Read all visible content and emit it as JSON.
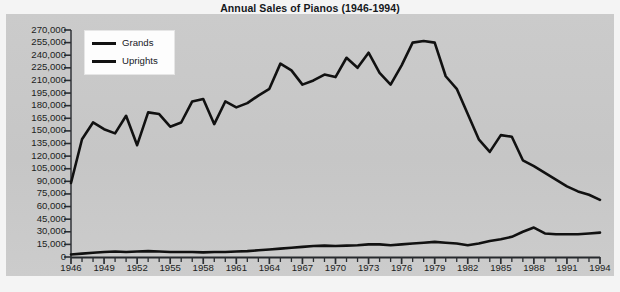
{
  "chart_data": {
    "type": "line",
    "title": "Annual Sales of Pianos (1946-1994)",
    "xlabel": "",
    "ylabel": "",
    "xlim": [
      1946,
      1994
    ],
    "ylim": [
      0,
      270000
    ],
    "ytick_step": 15000,
    "xtick_step": 3,
    "grid": false,
    "legend_position": "top-left",
    "yticks": [
      "270,000",
      "255,000",
      "240,000",
      "225,000",
      "210,000",
      "195,000",
      "180,000",
      "165,000",
      "150,000",
      "135,000",
      "120,000",
      "105,000",
      "90,000",
      "75,000",
      "60,000",
      "45,000",
      "30,000",
      "15,000",
      "0"
    ],
    "ytick_values": [
      270000,
      255000,
      240000,
      225000,
      210000,
      195000,
      180000,
      165000,
      150000,
      135000,
      120000,
      105000,
      90000,
      75000,
      60000,
      45000,
      30000,
      15000,
      0
    ],
    "xticks": [
      "1946",
      "1949",
      "1952",
      "1955",
      "1958",
      "1961",
      "1964",
      "1967",
      "1970",
      "1973",
      "1976",
      "1979",
      "1982",
      "1985",
      "1988",
      "1991",
      "1994"
    ],
    "xtick_values": [
      1946,
      1949,
      1952,
      1955,
      1958,
      1961,
      1964,
      1967,
      1970,
      1973,
      1976,
      1979,
      1982,
      1985,
      1988,
      1991,
      1994
    ],
    "x": [
      1946,
      1947,
      1948,
      1949,
      1950,
      1951,
      1952,
      1953,
      1954,
      1955,
      1956,
      1957,
      1958,
      1959,
      1960,
      1961,
      1962,
      1963,
      1964,
      1965,
      1966,
      1967,
      1968,
      1969,
      1970,
      1971,
      1972,
      1973,
      1974,
      1975,
      1976,
      1977,
      1978,
      1979,
      1980,
      1981,
      1982,
      1983,
      1984,
      1985,
      1986,
      1987,
      1988,
      1989,
      1990,
      1991,
      1992,
      1993,
      1994
    ],
    "series": [
      {
        "name": "Uprights",
        "color": "#111111",
        "values": [
          88000,
          140000,
          160000,
          152000,
          147000,
          168000,
          133000,
          172000,
          170000,
          155000,
          160000,
          185000,
          188000,
          158000,
          185000,
          178000,
          183000,
          192000,
          200000,
          230000,
          222000,
          205000,
          210000,
          217000,
          214000,
          237000,
          225000,
          243000,
          219000,
          205000,
          228000,
          255000,
          257000,
          255000,
          215000,
          200000,
          170000,
          140000,
          125000,
          145000,
          143000,
          115000,
          108000,
          100000,
          92000,
          84000,
          78000,
          74000,
          68000
        ]
      },
      {
        "name": "Grands",
        "color": "#111111",
        "values": [
          3000,
          4000,
          5000,
          6000,
          6500,
          6000,
          6500,
          7000,
          6500,
          6000,
          6000,
          6000,
          5500,
          6000,
          6000,
          6500,
          7000,
          8000,
          9000,
          10000,
          11000,
          12000,
          13000,
          13500,
          13000,
          13500,
          14000,
          15000,
          15000,
          14000,
          15000,
          16000,
          17000,
          18000,
          17000,
          16000,
          14000,
          16000,
          19000,
          21000,
          24000,
          30000,
          35000,
          28000,
          27000,
          27000,
          27000,
          28000,
          29000
        ]
      }
    ],
    "legend": [
      {
        "label": "Grands"
      },
      {
        "label": "Uprights"
      }
    ]
  }
}
